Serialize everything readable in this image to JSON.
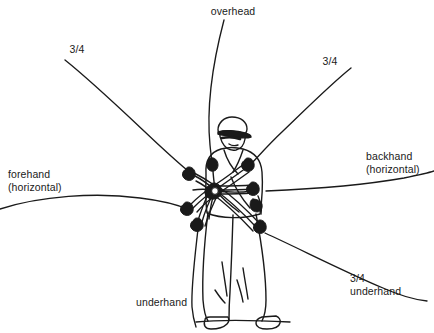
{
  "figure": {
    "style": "black and white line drawing",
    "background_color": "#ffffff",
    "line_color": "#1a1a1a",
    "text_color": "#1a1a1a",
    "hub": {
      "x": 215,
      "y": 190,
      "description": "central pivot where all arm arcs converge"
    }
  },
  "labels": {
    "overhead": "overhead",
    "three_quarter_left": "3/4",
    "three_quarter_right": "3/4",
    "forehand": "forehand\n(horizontal)",
    "backhand": "backhand\n(horizontal)",
    "three_quarter_underhand": "3/4\nunderhand",
    "underhand": "underhand"
  },
  "trajectories": [
    {
      "name": "overhead",
      "label": "overhead",
      "direction": "up",
      "start": [
        224,
        20
      ],
      "end": [
        212,
        166
      ]
    },
    {
      "name": "three-quarter-left",
      "label": "3/4",
      "direction": "upper-left",
      "start": [
        65,
        60
      ],
      "end": [
        192,
        174
      ]
    },
    {
      "name": "three-quarter-right",
      "label": "3/4",
      "direction": "upper-right",
      "start": [
        351,
        68
      ],
      "end": [
        249,
        166
      ]
    },
    {
      "name": "forehand-horizontal",
      "label": "forehand (horizontal)",
      "direction": "left",
      "start": [
        0,
        209
      ],
      "end": [
        190,
        210
      ]
    },
    {
      "name": "backhand-horizontal",
      "label": "backhand (horizontal)",
      "direction": "right",
      "start": [
        266,
        191
      ],
      "end": [
        434,
        171
      ]
    },
    {
      "name": "three-quarter-underhand",
      "label": "3/4 underhand",
      "direction": "lower-right",
      "start": [
        265,
        233
      ],
      "end": [
        427,
        301
      ]
    },
    {
      "name": "underhand",
      "label": "underhand",
      "direction": "down",
      "start": [
        198,
        229
      ],
      "end": [
        196,
        327
      ]
    }
  ]
}
